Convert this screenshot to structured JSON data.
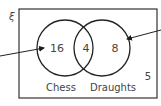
{
  "diagram": {
    "type": "venn",
    "universal_symbol": "ξ",
    "sets": [
      {
        "name": "Chess",
        "only_value": "16"
      },
      {
        "name": "Draughts",
        "only_value": "8"
      }
    ],
    "intersection_value": "4",
    "outside_value": "5",
    "colors": {
      "stroke": "#2b2b2b",
      "text": "#444444",
      "background": "#ffffff"
    }
  }
}
